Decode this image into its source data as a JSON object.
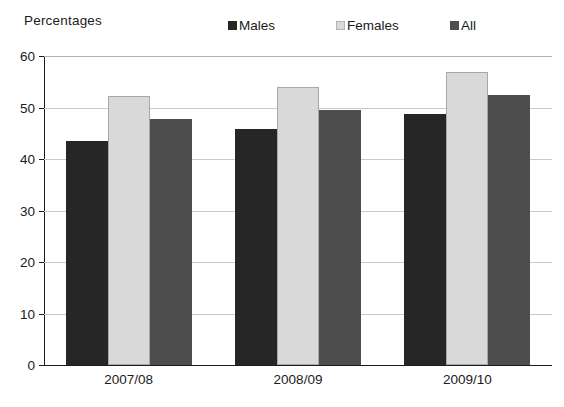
{
  "chart_data": {
    "type": "bar",
    "title": "",
    "subtitle": "",
    "ylabel": "Percentages",
    "xlabel": "",
    "ylim": [
      0,
      60
    ],
    "yticks": [
      0,
      10,
      20,
      30,
      40,
      50,
      60
    ],
    "ytick_labels": [
      "0",
      "10",
      "20",
      "30",
      "40",
      "50",
      "60"
    ],
    "grid": true,
    "legend_position": "top",
    "categories": [
      "2007/08",
      "2008/09",
      "2009/10"
    ],
    "series": [
      {
        "name": "Males",
        "color": "#262626",
        "outlined": false,
        "values": [
          43.5,
          45.8,
          48.7
        ]
      },
      {
        "name": "Females",
        "color": "#d9d9d9",
        "outlined": true,
        "values": [
          52.2,
          53.9,
          56.8
        ]
      },
      {
        "name": "All",
        "color": "#4d4d4d",
        "outlined": false,
        "values": [
          47.7,
          49.6,
          52.5
        ]
      }
    ]
  },
  "axis_caption": "Percentages",
  "legend": {
    "items": [
      {
        "label": "Males"
      },
      {
        "label": "Females"
      },
      {
        "label": "All"
      }
    ]
  },
  "colors": {
    "males": "#262626",
    "females": "#d9d9d9",
    "all": "#4d4d4d",
    "axis": "#1b1b1b",
    "gridline": "#c9c9c9",
    "background": "#ffffff"
  }
}
